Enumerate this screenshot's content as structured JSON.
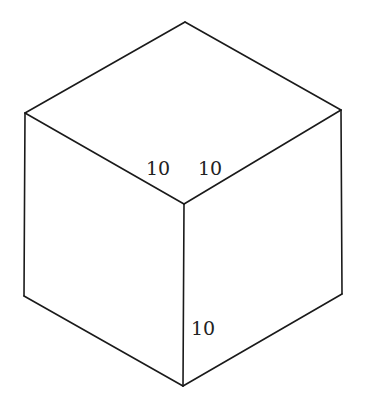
{
  "diagram": {
    "type": "isometric-cube",
    "stroke_color": "#1a1a1a",
    "background": "#ffffff",
    "vertices": {
      "top": [
        185,
        22
      ],
      "left": [
        25,
        113
      ],
      "right": [
        341,
        110
      ],
      "center": [
        184,
        204
      ],
      "bottom_left": [
        24,
        296
      ],
      "bottom_right": [
        342,
        294
      ],
      "bottom": [
        183,
        386
      ]
    },
    "labels": {
      "top_left_edge": "10",
      "top_right_edge": "10",
      "vertical_edge": "10"
    }
  }
}
